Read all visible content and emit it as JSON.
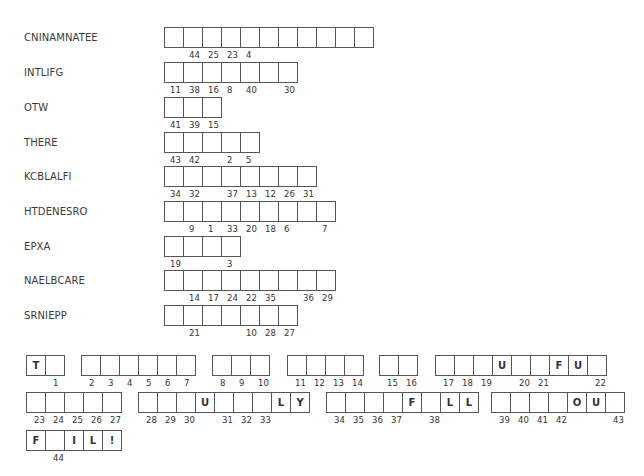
{
  "puzzle": {
    "words": [
      {
        "label": "CNINAMNATEE",
        "numbers": [
          "",
          "44",
          "25",
          "23",
          "4",
          "",
          "",
          "",
          "",
          "",
          ""
        ]
      },
      {
        "label": "INTLIFG",
        "numbers": [
          "11",
          "38",
          "16",
          "8",
          "40",
          "",
          "30"
        ]
      },
      {
        "label": "OTW",
        "numbers": [
          "41",
          "39",
          "15"
        ]
      },
      {
        "label": "THERE",
        "numbers": [
          "43",
          "42",
          "",
          "2",
          "5"
        ]
      },
      {
        "label": "KCBLALFI",
        "numbers": [
          "34",
          "32",
          "",
          "37",
          "13",
          "12",
          "26",
          "31"
        ]
      },
      {
        "label": "HTDENESRO",
        "numbers": [
          "",
          "9",
          "1",
          "33",
          "20",
          "18",
          "6",
          "",
          "7"
        ]
      },
      {
        "label": "EPXA",
        "numbers": [
          "19",
          "",
          "",
          "3"
        ]
      },
      {
        "label": "NAELBCARE",
        "numbers": [
          "",
          "14",
          "17",
          "24",
          "22",
          "35",
          "",
          "36",
          "29"
        ]
      },
      {
        "label": "SRNIEPP",
        "numbers": [
          "",
          "21",
          "",
          "",
          "10",
          "28",
          "27"
        ]
      }
    ],
    "answer": {
      "rows": [
        [
          {
            "cells": [
              {
                "letter": "T",
                "num": ""
              },
              {
                "letter": "",
                "num": "1"
              }
            ]
          },
          {
            "cells": [
              {
                "letter": "",
                "num": "2"
              },
              {
                "letter": "",
                "num": "3"
              },
              {
                "letter": "",
                "num": "4"
              },
              {
                "letter": "",
                "num": "5"
              },
              {
                "letter": "",
                "num": "6"
              },
              {
                "letter": "",
                "num": "7"
              }
            ]
          },
          {
            "cells": [
              {
                "letter": "",
                "num": "8"
              },
              {
                "letter": "",
                "num": "9"
              },
              {
                "letter": "",
                "num": "10"
              }
            ]
          },
          {
            "cells": [
              {
                "letter": "",
                "num": "11"
              },
              {
                "letter": "",
                "num": "12"
              },
              {
                "letter": "",
                "num": "13"
              },
              {
                "letter": "",
                "num": "14"
              }
            ]
          },
          {
            "cells": [
              {
                "letter": "",
                "num": "15"
              },
              {
                "letter": "",
                "num": "16"
              }
            ]
          },
          {
            "cells": [
              {
                "letter": "",
                "num": "17"
              },
              {
                "letter": "",
                "num": "18"
              },
              {
                "letter": "",
                "num": "19"
              },
              {
                "letter": "U",
                "num": ""
              },
              {
                "letter": "",
                "num": "20"
              },
              {
                "letter": "",
                "num": "21"
              },
              {
                "letter": "F",
                "num": ""
              },
              {
                "letter": "U",
                "num": ""
              },
              {
                "letter": "",
                "num": "22"
              }
            ]
          }
        ],
        [
          {
            "cells": [
              {
                "letter": "",
                "num": "23"
              },
              {
                "letter": "",
                "num": "24"
              },
              {
                "letter": "",
                "num": "25"
              },
              {
                "letter": "",
                "num": "26"
              },
              {
                "letter": "",
                "num": "27"
              }
            ]
          },
          {
            "cells": [
              {
                "letter": "",
                "num": "28"
              },
              {
                "letter": "",
                "num": "29"
              },
              {
                "letter": "",
                "num": "30"
              },
              {
                "letter": "U",
                "num": ""
              },
              {
                "letter": "",
                "num": "31"
              },
              {
                "letter": "",
                "num": "32"
              },
              {
                "letter": "",
                "num": "33"
              },
              {
                "letter": "L",
                "num": ""
              },
              {
                "letter": "Y",
                "num": ""
              }
            ]
          },
          {
            "cells": [
              {
                "letter": "",
                "num": "34"
              },
              {
                "letter": "",
                "num": "35"
              },
              {
                "letter": "",
                "num": "36"
              },
              {
                "letter": "",
                "num": "37"
              },
              {
                "letter": "F",
                "num": ""
              },
              {
                "letter": "",
                "num": "38"
              },
              {
                "letter": "L",
                "num": ""
              },
              {
                "letter": "L",
                "num": ""
              }
            ]
          },
          {
            "cells": [
              {
                "letter": "",
                "num": "39"
              },
              {
                "letter": "",
                "num": "40"
              },
              {
                "letter": "",
                "num": "41"
              },
              {
                "letter": "",
                "num": "42"
              },
              {
                "letter": "O",
                "num": ""
              },
              {
                "letter": "U",
                "num": ""
              },
              {
                "letter": "",
                "num": "43"
              }
            ]
          }
        ],
        [
          {
            "cells": [
              {
                "letter": "F",
                "num": ""
              },
              {
                "letter": "",
                "num": "44"
              },
              {
                "letter": "I",
                "num": ""
              },
              {
                "letter": "L",
                "num": ""
              },
              {
                "letter": "!",
                "num": ""
              }
            ]
          }
        ]
      ]
    }
  }
}
